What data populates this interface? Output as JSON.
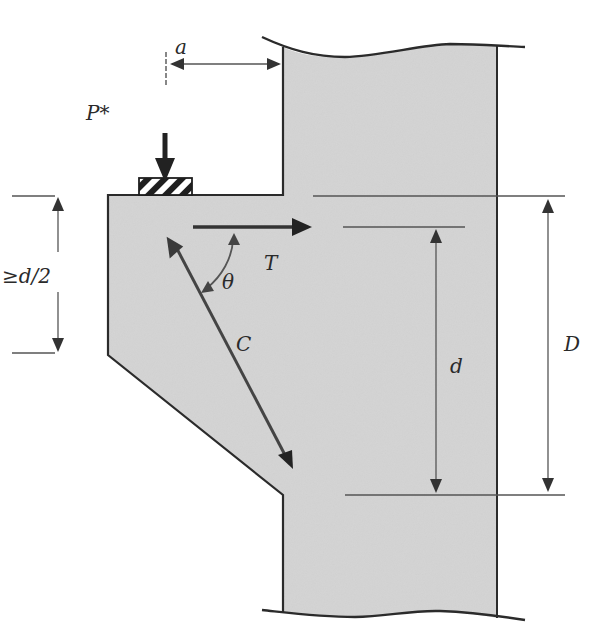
{
  "figure": {
    "colors": {
      "concrete_fill": "#d4d4d4",
      "outline": "#2b2b2b",
      "dim_line": "#555555",
      "force_arrow": "#333333",
      "background": "#ffffff"
    },
    "labels": {
      "load": "P*",
      "shear_span": "a",
      "min_outer_depth": "≥d/2",
      "tie_force": "T",
      "strut_force": "C",
      "strut_angle": "θ",
      "effective_depth": "d",
      "overall_depth": "D"
    },
    "icons": {
      "bearing_plate": "hatched-bearing-pad",
      "load_arrow": "arrow-down",
      "tie_arrow": "arrow-right",
      "strut_arrow": "double-arrow",
      "angle_arc": "curved-double-arrow"
    }
  }
}
